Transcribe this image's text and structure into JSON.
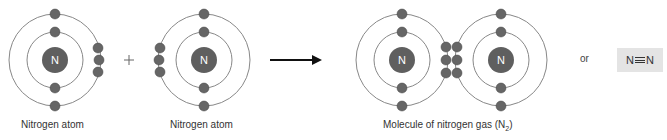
{
  "colors": {
    "electron": "#666666",
    "nucleus": "#5f5f5f",
    "orbit": "#888888",
    "arrow": "#111111",
    "formula_bg": "#e4e4e4"
  },
  "atoms": [
    {
      "label": "Nitrogen atom",
      "nucleus_symbol": "N"
    },
    {
      "label": "Nitrogen atom",
      "nucleus_symbol": "N"
    }
  ],
  "operator": "+",
  "molecule": {
    "label_prefix": "Molecule of nitrogen gas (N",
    "label_subscript": "2",
    "label_suffix": ")",
    "nucleus_symbols": [
      "N",
      "N"
    ]
  },
  "or_label": "or",
  "formula": {
    "left": "N",
    "bond": "triple-bond",
    "right": "N"
  }
}
